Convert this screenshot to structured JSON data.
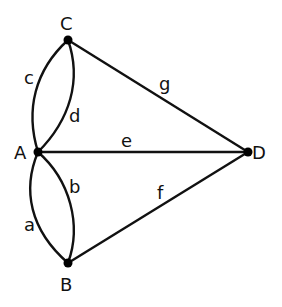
{
  "graph": {
    "nodes": [
      {
        "id": "A",
        "label": "A",
        "x": 38,
        "y": 152,
        "lx": 14,
        "ly": 159
      },
      {
        "id": "B",
        "label": "B",
        "x": 68,
        "y": 263,
        "lx": 60,
        "ly": 291
      },
      {
        "id": "C",
        "label": "C",
        "x": 68,
        "y": 40,
        "lx": 60,
        "ly": 30
      },
      {
        "id": "D",
        "label": "D",
        "x": 248,
        "y": 152,
        "lx": 252,
        "ly": 159
      }
    ],
    "edges": [
      {
        "id": "a",
        "label": "a",
        "from": "A",
        "to": "B",
        "lx": 24,
        "ly": 231
      },
      {
        "id": "b",
        "label": "b",
        "from": "A",
        "to": "B",
        "lx": 69,
        "ly": 193
      },
      {
        "id": "c",
        "label": "c",
        "from": "A",
        "to": "C",
        "lx": 24,
        "ly": 84
      },
      {
        "id": "d",
        "label": "d",
        "from": "A",
        "to": "C",
        "lx": 69,
        "ly": 122
      },
      {
        "id": "e",
        "label": "e",
        "from": "A",
        "to": "D",
        "lx": 121,
        "ly": 147
      },
      {
        "id": "f",
        "label": "f",
        "from": "B",
        "to": "D",
        "lx": 157,
        "ly": 199
      },
      {
        "id": "g",
        "label": "g",
        "from": "C",
        "to": "D",
        "lx": 159,
        "ly": 90
      }
    ]
  }
}
